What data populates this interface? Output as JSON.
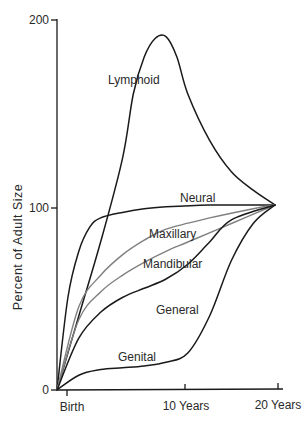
{
  "chart_data": {
    "type": "line",
    "title": "",
    "xlabel": "",
    "ylabel": "Percent of Adult Size",
    "ylim": [
      0,
      200
    ],
    "yticks": [
      0,
      100,
      200
    ],
    "ytick_labels": [
      "0",
      "100",
      "200"
    ],
    "xticks": [
      "Birth",
      "10 Years",
      "20 Years"
    ],
    "x_range_years": [
      0,
      20
    ],
    "grid": false,
    "legend": "none (curves labeled inline)",
    "series": [
      {
        "name": "Lymphoid",
        "color": "#1a1a1a",
        "points": [
          [
            0,
            0
          ],
          [
            2,
            40
          ],
          [
            4,
            80
          ],
          [
            6,
            125
          ],
          [
            7,
            160
          ],
          [
            8,
            180
          ],
          [
            9,
            190
          ],
          [
            10,
            191
          ],
          [
            11,
            180
          ],
          [
            12,
            160
          ],
          [
            14,
            135
          ],
          [
            16,
            118
          ],
          [
            18,
            108
          ],
          [
            20,
            100
          ]
        ]
      },
      {
        "name": "Neural",
        "color": "#1a1a1a",
        "points": [
          [
            0,
            0
          ],
          [
            1,
            50
          ],
          [
            2,
            75
          ],
          [
            3,
            88
          ],
          [
            4,
            93
          ],
          [
            6,
            96
          ],
          [
            8,
            98
          ],
          [
            10,
            99
          ],
          [
            14,
            100
          ],
          [
            18,
            100
          ],
          [
            20,
            100
          ]
        ]
      },
      {
        "name": "Maxillary",
        "color": "#808080",
        "points": [
          [
            0,
            0
          ],
          [
            2,
            45
          ],
          [
            4,
            62
          ],
          [
            6,
            73
          ],
          [
            8,
            81
          ],
          [
            10,
            87
          ],
          [
            14,
            93
          ],
          [
            18,
            98
          ],
          [
            20,
            100
          ]
        ]
      },
      {
        "name": "Mandibular",
        "color": "#808080",
        "points": [
          [
            0,
            0
          ],
          [
            2,
            38
          ],
          [
            4,
            53
          ],
          [
            6,
            62
          ],
          [
            8,
            69
          ],
          [
            10,
            75
          ],
          [
            12,
            80
          ],
          [
            16,
            90
          ],
          [
            20,
            100
          ]
        ]
      },
      {
        "name": "General",
        "color": "#1a1a1a",
        "points": [
          [
            0,
            0
          ],
          [
            2,
            28
          ],
          [
            4,
            42
          ],
          [
            6,
            50
          ],
          [
            8,
            55
          ],
          [
            10,
            60
          ],
          [
            12,
            68
          ],
          [
            14,
            80
          ],
          [
            16,
            92
          ],
          [
            20,
            100
          ]
        ]
      },
      {
        "name": "Genital",
        "color": "#1a1a1a",
        "points": [
          [
            0,
            0
          ],
          [
            2,
            8
          ],
          [
            4,
            11
          ],
          [
            6,
            12
          ],
          [
            8,
            13
          ],
          [
            10,
            15
          ],
          [
            12,
            20
          ],
          [
            14,
            40
          ],
          [
            16,
            70
          ],
          [
            18,
            90
          ],
          [
            20,
            100
          ]
        ]
      }
    ],
    "annotations": [
      {
        "text": "Lymphoid",
        "x": 5.2,
        "y": 152
      },
      {
        "text": "Neural",
        "x": 11.5,
        "y": 103
      },
      {
        "text": "Maxillary",
        "x": 9.2,
        "y": 88
      },
      {
        "text": "Mandibular",
        "x": 8.8,
        "y": 73
      },
      {
        "text": "General",
        "x": 9.6,
        "y": 40
      },
      {
        "text": "Genital",
        "x": 4.0,
        "y": 19
      }
    ]
  },
  "labels": {
    "y_axis": "Percent of Adult Size",
    "y200": "200",
    "y100": "100",
    "y0": "0",
    "x_birth": "Birth",
    "x_10": "10 Years",
    "x_20": "20 Years",
    "lymphoid": "Lymphoid",
    "neural": "Neural",
    "maxillary": "Maxillary",
    "mandibular": "Mandibular",
    "general": "General",
    "genital": "Genital"
  }
}
